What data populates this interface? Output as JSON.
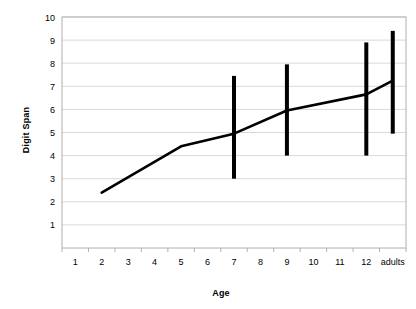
{
  "chart_data": {
    "type": "line",
    "title": "",
    "xlabel": "Age",
    "ylabel": "Digit Span",
    "x_tick_labels": [
      "1",
      "2",
      "3",
      "4",
      "5",
      "6",
      "7",
      "8",
      "9",
      "10",
      "11",
      "12",
      "adults"
    ],
    "y_tick_labels": [
      "1",
      "2",
      "3",
      "4",
      "5",
      "6",
      "7",
      "8",
      "9",
      "10"
    ],
    "ylim": [
      0,
      10
    ],
    "grid": "horizontal",
    "legend": "none",
    "series": [
      {
        "name": "Digit Span",
        "x": [
          "2",
          "5",
          "7",
          "9",
          "12",
          "adults"
        ],
        "values": [
          2.4,
          4.4,
          4.95,
          5.95,
          6.65,
          7.25
        ]
      }
    ],
    "error_bars": [
      {
        "x": "7",
        "low": 3.0,
        "high": 7.45
      },
      {
        "x": "9",
        "low": 4.0,
        "high": 7.95
      },
      {
        "x": "12",
        "low": 4.0,
        "high": 8.9
      },
      {
        "x": "adults",
        "low": 4.95,
        "high": 9.4
      }
    ],
    "colors": {
      "line": "#000000",
      "error_bar": "#000000",
      "grid": "#d9d9d9",
      "axis": "#b0b0b0",
      "background": "#ffffff"
    }
  }
}
